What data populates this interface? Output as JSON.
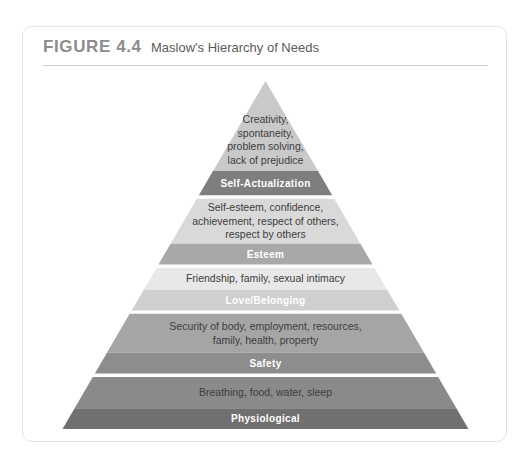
{
  "figure": {
    "number_label": "FIGURE 4.4",
    "title": "Maslow's Hierarchy of Needs"
  },
  "chart_data": {
    "type": "diagram",
    "diagram_kind": "pyramid",
    "title": "Maslow's Hierarchy of Needs",
    "tier_count": 5,
    "order": "top-to-bottom",
    "tiers": [
      {
        "level": 5,
        "label": "Self-Actualization",
        "content": "Creativity, spontaneity, problem solving, lack of prejudice",
        "content_lines": [
          "Creativity,",
          "spontaneity,",
          "problem solving,",
          "lack of prejudice"
        ],
        "content_color": "#c9c9c9",
        "label_color": "#7e7e7e",
        "label_text_color": "#ffffff"
      },
      {
        "level": 4,
        "label": "Esteem",
        "content": "Self-esteem, confidence, achievement, respect of others, respect by others",
        "content_lines": [
          "Self-esteem, confidence,",
          "achievement, respect of others,",
          "respect by others"
        ],
        "content_color": "#d9d9d9",
        "label_color": "#a8a8a8",
        "label_text_color": "#ffffff"
      },
      {
        "level": 3,
        "label": "Love/Belonging",
        "content": "Friendship, family, sexual intimacy",
        "content_lines": [
          "Friendship, family, sexual intimacy"
        ],
        "content_color": "#e8e8e8",
        "label_color": "#cfcfcf",
        "label_text_color": "#ffffff"
      },
      {
        "level": 2,
        "label": "Safety",
        "content": "Security of body, employment, resources, family, health, property",
        "content_lines": [
          "Security of body, employment, resources,",
          "family, health, property"
        ],
        "content_color": "#a5a5a5",
        "label_color": "#8d8d8d",
        "label_text_color": "#ffffff"
      },
      {
        "level": 1,
        "label": "Physiological",
        "content": "Breathing, food, water, sleep",
        "content_lines": [
          "Breathing, food, water, sleep"
        ],
        "content_color": "#8a8a8a",
        "label_color": "#707070",
        "label_text_color": "#ffffff"
      }
    ]
  }
}
